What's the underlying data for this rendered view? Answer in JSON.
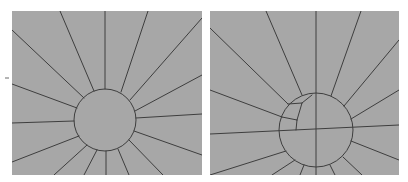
{
  "figure": {
    "colors": {
      "background": "#ffffff",
      "panel_fill": "#a7a7a7",
      "line": "#3e3e3e"
    }
  },
  "panels": [
    {
      "id": "left",
      "rect": {
        "x": 12,
        "y": 11,
        "w": 190,
        "h": 164
      },
      "circle": {
        "cx": 105,
        "cy": 120,
        "r": 31
      },
      "spokes": [
        [
          60,
          11,
          94,
          91
        ],
        [
          105,
          11,
          105,
          89
        ],
        [
          148,
          11,
          121,
          92
        ],
        [
          202,
          18,
          130,
          100
        ],
        [
          12,
          30,
          84,
          98
        ],
        [
          202,
          75,
          135,
          111
        ],
        [
          12,
          84,
          77,
          108
        ],
        [
          202,
          114,
          136,
          118
        ],
        [
          12,
          123,
          74,
          121
        ],
        [
          202,
          155,
          134,
          131
        ],
        [
          12,
          162,
          79,
          136
        ],
        [
          54,
          175,
          87,
          145
        ],
        [
          84,
          175,
          97,
          150
        ],
        [
          106,
          175,
          106,
          151
        ],
        [
          129,
          175,
          118,
          149
        ],
        [
          163,
          175,
          129,
          140
        ]
      ]
    },
    {
      "id": "right",
      "rect": {
        "x": 210,
        "y": 11,
        "w": 189,
        "h": 164
      },
      "circle": {
        "cx": 316,
        "cy": 130,
        "r": 37
      },
      "spokes": [
        [
          266,
          11,
          302,
          95
        ],
        [
          316,
          11,
          316,
          175
        ],
        [
          361,
          11,
          331,
          96
        ],
        [
          399,
          40,
          344,
          106
        ],
        [
          210,
          28,
          288,
          104
        ],
        [
          399,
          90,
          351,
          119
        ],
        [
          210,
          90,
          282,
          117
        ],
        [
          210,
          134,
          399,
          125
        ],
        [
          399,
          160,
          351,
          141
        ],
        [
          210,
          175,
          286,
          151
        ],
        [
          272,
          175,
          295,
          160
        ],
        [
          300,
          175,
          304,
          165
        ],
        [
          335,
          175,
          330,
          165
        ],
        [
          362,
          175,
          343,
          157
        ]
      ],
      "inner_lines": [
        [
          288,
          104,
          302,
          103
        ],
        [
          302,
          103,
          297,
          120
        ],
        [
          297,
          120,
          296,
          130
        ],
        [
          282,
          117,
          297,
          120
        ],
        [
          302,
          103,
          312,
          95
        ]
      ]
    }
  ],
  "marks": [
    {
      "type": "dash",
      "x1": 5,
      "y1": 78,
      "x2": 9,
      "y2": 78
    }
  ]
}
